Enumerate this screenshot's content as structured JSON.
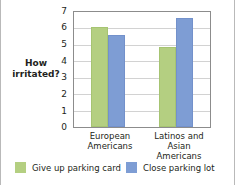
{
  "chart_data": {
    "type": "bar",
    "title": "",
    "xlabel": "",
    "ylabel": "How irritated?",
    "ylabel_lines": [
      "How",
      "irritated?"
    ],
    "ylim": [
      0,
      7
    ],
    "yticks": [
      0,
      1,
      2,
      3,
      4,
      5,
      6,
      7
    ],
    "ytick_labels": [
      "0",
      "1",
      "2",
      "3",
      "4",
      "5",
      "6",
      "7"
    ],
    "grid": true,
    "grid_axis": "y",
    "legend_position": "bottom",
    "categories": [
      "European Americans",
      "Latinos and Asian Americans"
    ],
    "category_lines": [
      [
        "European",
        "Americans"
      ],
      [
        "Latinos and Asian",
        "Americans"
      ]
    ],
    "series": [
      {
        "name": "Give up parking card",
        "color": "#b4cf81",
        "values": [
          6.1,
          4.85
        ]
      },
      {
        "name": "Close parking lot",
        "color": "#7e9dd4",
        "values": [
          5.6,
          6.65
        ]
      }
    ]
  },
  "legend": {
    "items": [
      {
        "label": "Give up parking card",
        "color": "#b4cf81",
        "swatch": "green"
      },
      {
        "label": "Close parking lot",
        "color": "#7e9dd4",
        "swatch": "blue"
      }
    ]
  },
  "axis": {
    "y_title_line_1": "How",
    "y_title_line_2": "irritated?",
    "tick_0": "0",
    "tick_1": "1",
    "tick_2": "2",
    "tick_3": "3",
    "tick_4": "4",
    "tick_5": "5",
    "tick_6": "6",
    "tick_7": "7"
  },
  "categories": {
    "cat0_line1": "European",
    "cat0_line2": "Americans",
    "cat1_line1": "Latinos and Asian",
    "cat1_line2": "Americans"
  },
  "colors": {
    "green": "#b4cf81",
    "blue": "#7e9dd4",
    "grid": "#d2d2d2",
    "frame": "#8c8c8c",
    "text": "#231f20",
    "background": "#ffffff"
  }
}
